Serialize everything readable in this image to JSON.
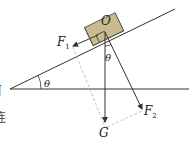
{
  "diagram": {
    "type": "force-decomposition-on-incline",
    "colors": {
      "line": "#333333",
      "block_fill": "#c9bb8f",
      "block_stroke": "#3a3a3a",
      "dashed": "#a8a8a8",
      "background": "#ffffff"
    },
    "labels": {
      "block_point": "O",
      "force_parallel": "F",
      "force_parallel_sub": "1",
      "force_perpendicular": "F",
      "force_perpendicular_sub": "2",
      "gravity": "G",
      "incline_angle": "θ",
      "force_angle": "θ"
    },
    "edge_fragments": [
      "J",
      "连"
    ]
  }
}
